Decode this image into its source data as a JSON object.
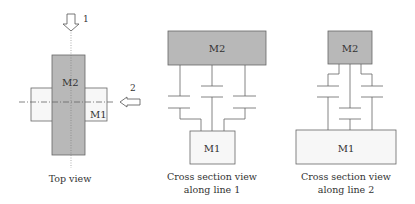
{
  "colors": {
    "shaded": "#b8b8b8",
    "light": "#f7f7f7",
    "stroke": "#666666",
    "text": "#333333"
  },
  "top_view": {
    "m2_label": "M2",
    "m1_label": "M1",
    "arrow1_label": "1",
    "arrow2_label": "2",
    "caption": "Top view"
  },
  "section1": {
    "m2_label": "M2",
    "m1_label": "M1",
    "caption_line1": "Cross section view",
    "caption_line2": "along line 1"
  },
  "section2": {
    "m2_label": "M2",
    "m1_label": "M1",
    "caption_line1": "Cross section view",
    "caption_line2": "along line 2"
  }
}
